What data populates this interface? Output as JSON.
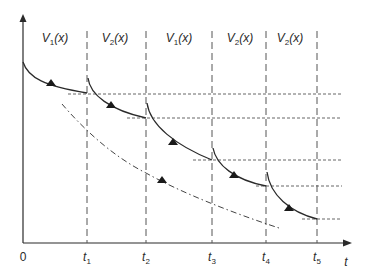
{
  "diagram": {
    "type": "switched-system-trajectory",
    "axes": {
      "x_label": "t",
      "origin_label": "0",
      "has_y_arrow": true,
      "has_x_arrow": true
    },
    "switching_times": [
      {
        "name": "t",
        "sub": "1"
      },
      {
        "name": "t",
        "sub": "2"
      },
      {
        "name": "t",
        "sub": "3"
      },
      {
        "name": "t",
        "sub": "4"
      },
      {
        "name": "t",
        "sub": "5"
      }
    ],
    "regions": [
      {
        "func": "V",
        "sub": "1",
        "arg": "(x)"
      },
      {
        "func": "V",
        "sub": "2",
        "arg": "(x)"
      },
      {
        "func": "V",
        "sub": "1",
        "arg": "(x)"
      },
      {
        "func": "V",
        "sub": "2",
        "arg": "(x)"
      },
      {
        "func": "V",
        "sub": "2",
        "arg": "(x)"
      }
    ],
    "curves": {
      "solid_segments": 5,
      "dash_dot_bound": true,
      "direction_arrows": 6
    },
    "colors": {
      "line": "#2a2a2a",
      "dashed": "#555555",
      "background": "#ffffff"
    }
  }
}
